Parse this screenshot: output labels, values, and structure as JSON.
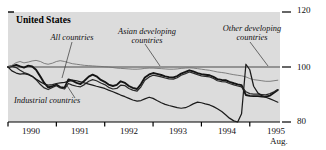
{
  "chart_data": {
    "type": "line",
    "title": "United States",
    "xlabel": "",
    "ylabel": "",
    "ylim": [
      80,
      120
    ],
    "xlim": [
      1990.0,
      1995.625
    ],
    "grid": false,
    "gridlines": [
      100
    ],
    "axis_position": "right",
    "y_ticks": [
      80,
      100,
      120
    ],
    "y_tick_labels": [
      "80",
      "100",
      "120"
    ],
    "x_ticks": [
      1990,
      1991,
      1992,
      1993,
      1994,
      1995
    ],
    "x_tick_labels": [
      "1990",
      "1991",
      "1992",
      "1993",
      "1994",
      "1995"
    ],
    "x_end_note": "Aug.",
    "legend_position": "inline-annotations",
    "annotations": [
      {
        "text": "All countries",
        "x_px": 72,
        "y_px": 38
      },
      {
        "text": "Asian developing\ncountries",
        "x_px": 146,
        "y_px": 33
      },
      {
        "text": "Other developing\ncountries",
        "x_px": 252,
        "y_px": 30
      },
      {
        "text": "Industrial countries",
        "x_px": 61,
        "y_px": 101
      }
    ],
    "series": [
      {
        "name": "All countries",
        "weight": "heavy",
        "color": "#141414",
        "x": [
          1990.0,
          1990.08,
          1990.17,
          1990.25,
          1990.33,
          1990.42,
          1990.5,
          1990.58,
          1990.67,
          1990.75,
          1990.83,
          1990.92,
          1991.0,
          1991.08,
          1991.17,
          1991.25,
          1991.33,
          1991.42,
          1991.5,
          1991.58,
          1991.67,
          1991.75,
          1991.83,
          1991.92,
          1992.0,
          1992.08,
          1992.17,
          1992.25,
          1992.33,
          1992.42,
          1992.5,
          1992.58,
          1992.67,
          1992.75,
          1992.83,
          1992.92,
          1993.0,
          1993.08,
          1993.17,
          1993.25,
          1993.33,
          1993.42,
          1993.5,
          1993.58,
          1993.67,
          1993.75,
          1993.83,
          1993.92,
          1994.0,
          1994.08,
          1994.17,
          1994.25,
          1994.33,
          1994.42,
          1994.5,
          1994.58,
          1994.67,
          1994.75,
          1994.83,
          1994.92,
          1995.0,
          1995.08,
          1995.17,
          1995.25,
          1995.33,
          1995.42,
          1995.5,
          1995.58
        ],
        "values": [
          100.0,
          100.3,
          100.8,
          100.2,
          99.8,
          100.5,
          100.2,
          99.0,
          96.5,
          94.2,
          92.6,
          93.0,
          93.6,
          92.7,
          92.5,
          95.5,
          95.0,
          94.2,
          93.8,
          95.0,
          96.5,
          97.2,
          96.6,
          95.3,
          94.6,
          93.6,
          93.1,
          93.5,
          94.8,
          94.2,
          93.1,
          92.4,
          92.0,
          93.8,
          96.2,
          97.3,
          97.8,
          97.5,
          97.1,
          96.6,
          96.3,
          96.2,
          96.7,
          97.6,
          98.2,
          98.8,
          98.4,
          97.8,
          97.4,
          97.2,
          97.0,
          96.4,
          95.6,
          95.3,
          95.2,
          94.6,
          94.1,
          93.7,
          93.4,
          89.8,
          89.5,
          89.4,
          89.4,
          89.3,
          89.2,
          89.6,
          90.6,
          91.6
        ]
      },
      {
        "name": "Industrial countries",
        "weight": "medium",
        "color": "#2a2a2a",
        "x": [
          1990.0,
          1990.08,
          1990.17,
          1990.25,
          1990.33,
          1990.42,
          1990.5,
          1990.58,
          1990.67,
          1990.75,
          1990.83,
          1990.92,
          1991.0,
          1991.08,
          1991.17,
          1991.25,
          1991.33,
          1991.42,
          1991.5,
          1991.58,
          1991.67,
          1991.75,
          1991.83,
          1991.92,
          1992.0,
          1992.08,
          1992.17,
          1992.25,
          1992.33,
          1992.42,
          1992.5,
          1992.58,
          1992.67,
          1992.75,
          1992.83,
          1992.92,
          1993.0,
          1993.08,
          1993.17,
          1993.25,
          1993.33,
          1993.42,
          1993.5,
          1993.58,
          1993.67,
          1993.75,
          1993.83,
          1993.92,
          1994.0,
          1994.08,
          1994.17,
          1994.25,
          1994.33,
          1994.42,
          1994.5,
          1994.58,
          1994.67,
          1994.75,
          1994.83,
          1994.92,
          1995.0,
          1995.08,
          1995.17,
          1995.25,
          1995.33,
          1995.42,
          1995.5,
          1995.58
        ],
        "values": [
          100.0,
          100.2,
          99.8,
          98.8,
          98.0,
          97.4,
          96.6,
          95.4,
          93.6,
          92.4,
          91.8,
          92.6,
          93.2,
          92.4,
          92.0,
          94.0,
          93.4,
          93.0,
          92.8,
          93.6,
          94.8,
          95.4,
          95.0,
          94.2,
          93.6,
          92.6,
          92.0,
          92.2,
          93.4,
          93.2,
          92.2,
          91.6,
          91.2,
          92.8,
          95.2,
          96.4,
          97.0,
          96.8,
          96.4,
          96.0,
          95.7,
          95.6,
          96.1,
          97.0,
          97.6,
          98.2,
          97.8,
          97.2,
          96.8,
          96.6,
          96.4,
          95.8,
          95.0,
          94.7,
          94.6,
          94.0,
          93.5,
          93.1,
          92.8,
          91.0,
          90.3,
          90.1,
          90.1,
          90.0,
          89.9,
          90.3,
          91.0,
          91.8
        ]
      },
      {
        "name": "Asian developing countries",
        "weight": "thin",
        "color": "#6e6e6e",
        "x": [
          1990.0,
          1990.08,
          1990.17,
          1990.25,
          1990.33,
          1990.42,
          1990.5,
          1990.58,
          1990.67,
          1990.75,
          1990.83,
          1990.92,
          1991.0,
          1991.08,
          1991.17,
          1991.25,
          1991.33,
          1991.42,
          1991.5,
          1991.58,
          1991.67,
          1991.75,
          1991.83,
          1991.92,
          1992.0,
          1992.08,
          1992.17,
          1992.25,
          1992.33,
          1992.42,
          1992.5,
          1992.58,
          1992.67,
          1992.75,
          1992.83,
          1992.92,
          1993.0,
          1993.08,
          1993.17,
          1993.25,
          1993.33,
          1993.42,
          1993.5,
          1993.58,
          1993.67,
          1993.75,
          1993.83,
          1993.92,
          1994.0,
          1994.08,
          1994.17,
          1994.25,
          1994.33,
          1994.42,
          1994.5,
          1994.58,
          1994.67,
          1994.75,
          1994.83,
          1994.92,
          1995.0,
          1995.08,
          1995.17,
          1995.25,
          1995.33,
          1995.42,
          1995.5,
          1995.58
        ],
        "values": [
          100.0,
          100.6,
          101.6,
          102.0,
          101.5,
          101.8,
          102.2,
          102.4,
          102.0,
          101.3,
          101.0,
          101.4,
          102.0,
          102.3,
          102.0,
          101.6,
          101.2,
          101.0,
          100.8,
          100.6,
          100.5,
          100.4,
          100.3,
          100.2,
          100.1,
          100.0,
          99.8,
          99.6,
          99.5,
          99.4,
          99.3,
          99.2,
          99.2,
          99.3,
          99.5,
          99.6,
          99.6,
          99.5,
          99.4,
          99.3,
          99.2,
          99.2,
          99.3,
          99.5,
          99.6,
          99.7,
          99.6,
          99.4,
          99.2,
          99.0,
          98.8,
          98.5,
          98.2,
          98.0,
          97.8,
          97.5,
          97.2,
          97.0,
          96.8,
          96.4,
          95.8,
          95.4,
          95.2,
          95.0,
          94.8,
          94.8,
          95.0,
          95.2
        ]
      },
      {
        "name": "Other developing countries",
        "weight": "medium",
        "color": "#1c1c1c",
        "x": [
          1990.0,
          1990.08,
          1990.17,
          1990.25,
          1990.33,
          1990.42,
          1990.5,
          1990.58,
          1990.67,
          1990.75,
          1990.83,
          1990.92,
          1991.0,
          1991.08,
          1991.17,
          1991.25,
          1991.33,
          1991.42,
          1991.5,
          1991.58,
          1991.67,
          1991.75,
          1991.83,
          1991.92,
          1992.0,
          1992.08,
          1992.17,
          1992.25,
          1992.33,
          1992.42,
          1992.5,
          1992.58,
          1992.67,
          1992.75,
          1992.83,
          1992.92,
          1993.0,
          1993.08,
          1993.17,
          1993.25,
          1993.33,
          1993.42,
          1993.5,
          1993.58,
          1993.67,
          1993.75,
          1993.83,
          1993.92,
          1994.0,
          1994.08,
          1994.17,
          1994.25,
          1994.33,
          1994.42,
          1994.5,
          1994.58,
          1994.67,
          1994.75,
          1994.83,
          1994.92,
          1995.0,
          1995.08,
          1995.17,
          1995.25,
          1995.33,
          1995.42,
          1995.5,
          1995.58
        ],
        "values": [
          100.0,
          98.6,
          97.8,
          97.4,
          97.6,
          97.2,
          96.6,
          95.6,
          94.6,
          93.8,
          93.4,
          93.6,
          94.0,
          94.2,
          94.4,
          94.8,
          95.2,
          95.0,
          94.6,
          94.2,
          93.8,
          93.4,
          93.0,
          92.6,
          92.2,
          91.6,
          91.0,
          90.4,
          89.8,
          89.2,
          88.6,
          88.0,
          87.6,
          87.8,
          88.4,
          89.0,
          88.6,
          87.8,
          87.0,
          86.4,
          86.0,
          85.6,
          85.2,
          85.0,
          85.2,
          85.8,
          86.6,
          87.2,
          87.0,
          86.6,
          86.2,
          85.6,
          84.8,
          83.8,
          82.6,
          81.4,
          80.4,
          80.0,
          83.0,
          101.0,
          99.0,
          93.0,
          90.5,
          89.6,
          89.0,
          88.4,
          87.8,
          87.2
        ]
      }
    ]
  },
  "axis": {
    "y_right_labels": [
      "120",
      "100",
      "80"
    ],
    "x_labels": [
      "1990",
      "1991",
      "1992",
      "1993",
      "1994",
      "1995"
    ],
    "x_sublabel": "Aug."
  },
  "labels": {
    "title": "United States",
    "all_countries": "All countries",
    "asian_developing_line1": "Asian developing",
    "asian_developing_line2": "countries",
    "other_developing_line1": "Other developing",
    "other_developing_line2": "countries",
    "industrial_countries": "Industrial countries"
  },
  "colors": {
    "plot_background": "#dcdcdc",
    "page_background": "#ffffff",
    "axis": "#000000",
    "gridline_100": "#4a4a4a",
    "series_all": "#141414",
    "series_industrial": "#2a2a2a",
    "series_asian": "#6e6e6e",
    "series_other": "#1c1c1c"
  }
}
